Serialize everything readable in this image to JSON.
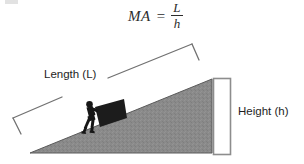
{
  "figure": {
    "formula": {
      "left_side": "MA",
      "equals": "=",
      "numerator": "L",
      "denominator": "h"
    },
    "labels": {
      "length": "Length (L)",
      "height": "Height (h)"
    },
    "colors": {
      "ramp_fill": "#8a8a8a",
      "ramp_stroke": "#4a4a4a",
      "silhouette": "#1a1a1a",
      "bracket_stroke": "#6e6e6e",
      "text": "#1e1e1e",
      "background": "#ffffff"
    },
    "elements": {
      "ramp": "gray right triangle inclined plane",
      "person": "silhouette of person pushing box",
      "box": "dark rectangular crate on ramp",
      "length_bracket": "slanted bracket along hypotenuse",
      "height_bracket": "vertical rectangular bracket on right side"
    }
  }
}
